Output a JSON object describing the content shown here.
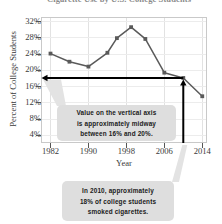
{
  "chart_data": {
    "type": "line",
    "title": "Cigarette Use by U.S. College Students",
    "xlabel": "Year",
    "ylabel": "Percent of College Students",
    "xlim": [
      1980,
      2015
    ],
    "ylim": [
      2,
      33
    ],
    "grid": true,
    "legend": "none",
    "x_ticks": [
      "1982",
      "1990",
      "1998",
      "2006",
      "2014"
    ],
    "y_ticks": [
      "32%",
      "28%",
      "24%",
      "20%",
      "16%",
      "12%",
      "8%",
      "4%"
    ],
    "series": [
      {
        "name": "Percent of college students who smoked cigarettes",
        "marker": "square",
        "color": "#5a5a5a",
        "x": [
          1982,
          1986,
          1990,
          1994,
          1996,
          1999,
          2002,
          2006,
          2010,
          2014
        ],
        "values": [
          24.0,
          22.0,
          20.8,
          24.2,
          27.8,
          30.5,
          27.6,
          19.3,
          18.0,
          13.5
        ]
      }
    ],
    "annotations": [
      {
        "name": "horizontal-reference-arrow",
        "kind": "arrow",
        "y": 18.0,
        "from_x": 2010,
        "to_x": 1982,
        "direction": "left",
        "color": "#000000"
      },
      {
        "name": "vertical-reference-arrow",
        "kind": "arrow",
        "x": 2010,
        "from_y": 2,
        "to_y": 18.0,
        "direction": "up",
        "color": "#000000"
      },
      {
        "name": "midway-callout",
        "kind": "callout",
        "lines": [
          "Value on the vertical axis",
          "is approximately midway",
          "between 16% and 20%."
        ],
        "points_to": "horizontal-reference-arrow"
      },
      {
        "name": "2010-callout",
        "kind": "callout",
        "lines": [
          "In 2010, approximately",
          "18% of college students",
          "smoked cigarettes."
        ],
        "points_to": "vertical-reference-arrow"
      }
    ]
  },
  "axes": {
    "y_title": "Percent of College Students",
    "x_title": "Year",
    "y_labels": [
      "32%",
      "28%",
      "24%",
      "20%",
      "16%",
      "12%",
      "8%",
      "4%"
    ],
    "x_labels": [
      "1982",
      "1990",
      "1998",
      "2006",
      "2014"
    ]
  },
  "header": {
    "title": "Cigarette Use by U.S. College Students"
  },
  "callouts": {
    "midway": {
      "line1": "Value on the vertical axis",
      "line2": "is approximately midway",
      "line3": "between 16% and 20%."
    },
    "year2010": {
      "line1": "In 2010, approximately",
      "line2": "18% of college students",
      "line3": "smoked cigarettes."
    }
  }
}
